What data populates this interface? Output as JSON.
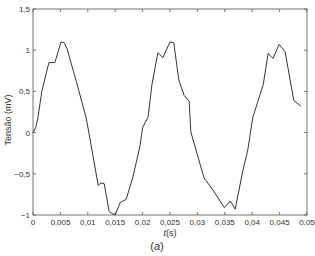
{
  "chart_data": {
    "type": "line",
    "title": "",
    "caption": "(a)",
    "caption_prefix": "(",
    "caption_letter": "a",
    "caption_suffix": ")",
    "xlabel": "t(s)",
    "xlabel_var": "t",
    "xlabel_unit": "(s)",
    "ylabel": "Tensão (mV)",
    "xlim": [
      0,
      0.05
    ],
    "ylim": [
      -1,
      1.5
    ],
    "grid": false,
    "legend": null,
    "x_ticks": [
      0,
      0.005,
      0.01,
      0.015,
      0.02,
      0.025,
      0.03,
      0.035,
      0.04,
      0.045,
      0.05
    ],
    "x_tick_labels": [
      "0",
      "0,005",
      "0,01",
      "0,015",
      "0,02",
      "0,025",
      "0,03",
      "0,035",
      "0,04",
      "0,045",
      "0,05"
    ],
    "y_ticks": [
      -1,
      -0.5,
      0,
      0.5,
      1,
      1.5
    ],
    "y_tick_labels": [
      "-1",
      "-0,5",
      "0",
      "0,5",
      "1",
      "1,5"
    ],
    "line_color": "#333333",
    "series": [
      {
        "name": "Tensão",
        "x": [
          0,
          0.00055,
          0.0009,
          0.0016,
          0.0029,
          0.004,
          0.0051,
          0.0057,
          0.0062,
          0.008,
          0.0097,
          0.0104,
          0.0119,
          0.0124,
          0.013,
          0.0139,
          0.0144,
          0.015,
          0.0159,
          0.017,
          0.0182,
          0.0195,
          0.02,
          0.021,
          0.0217,
          0.0228,
          0.0237,
          0.025,
          0.0257,
          0.0266,
          0.0276,
          0.0285,
          0.0288,
          0.0312,
          0.0328,
          0.0349,
          0.036,
          0.0369,
          0.0383,
          0.0392,
          0.0401,
          0.0409,
          0.042,
          0.0429,
          0.0438,
          0.0449,
          0.046,
          0.0476,
          0.0489
        ],
        "y": [
          0,
          0.07,
          0.18,
          0.5,
          0.85,
          0.85,
          1.1,
          1.09,
          1.02,
          0.6,
          0.18,
          -0.08,
          -0.64,
          -0.61,
          -0.62,
          -0.96,
          -0.98,
          -1.0,
          -0.85,
          -0.81,
          -0.55,
          -0.17,
          0.06,
          0.19,
          0.58,
          0.97,
          0.91,
          1.1,
          1.09,
          0.64,
          0.45,
          0.38,
          0.01,
          -0.55,
          -0.69,
          -0.91,
          -0.83,
          -0.93,
          -0.46,
          -0.21,
          0.18,
          0.35,
          0.58,
          0.96,
          0.9,
          1.07,
          0.98,
          0.39,
          0.32
        ]
      }
    ]
  }
}
